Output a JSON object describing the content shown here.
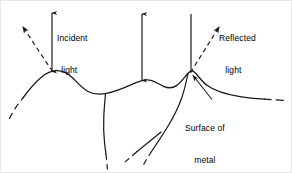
{
  "figure": {
    "stroke_color": "#1a1a1a",
    "background_color": "#ffffff",
    "labels": {
      "incident": {
        "line1": "Incident",
        "line2": "light"
      },
      "reflected": {
        "line1": "Reflected",
        "line2": "light"
      },
      "surface": {
        "line1": "Surface of",
        "line2": "metal"
      }
    },
    "elements": {
      "incident_ray_left": "vertical-down-arrow",
      "reflected_ray_left": "dashed-up-left-arrow",
      "normal_ray_middle": "vertical-double-arrow",
      "incident_ray_right": "vertical-line",
      "reflected_ray_right": "dashed-up-right-arrow",
      "surface_profile": "irregular-curve",
      "subsurface_cracks": "two-descending-lines",
      "leader_line": "surface-callout-pointer"
    }
  }
}
